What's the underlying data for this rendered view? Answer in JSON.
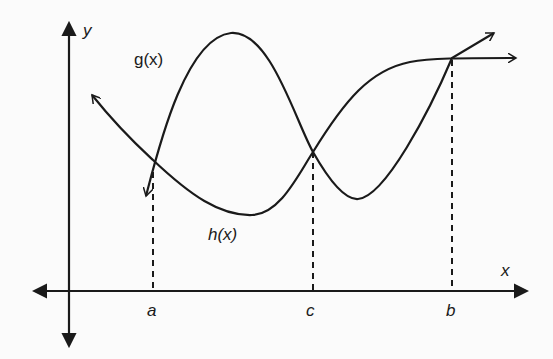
{
  "diagram": {
    "type": "function-graph",
    "axes": {
      "x_label": "x",
      "y_label": "y"
    },
    "functions": [
      {
        "name": "g",
        "label": "g(x)"
      },
      {
        "name": "h",
        "label": "h(x)"
      }
    ],
    "x_markers": [
      {
        "label": "a",
        "meaning": "intersection of g and h"
      },
      {
        "label": "c",
        "meaning": "intersection of g and h"
      },
      {
        "label": "b",
        "meaning": "intersection of g and h"
      }
    ],
    "colors": {
      "stroke": "#1a1a1a",
      "background": "#fbfbfb"
    }
  }
}
